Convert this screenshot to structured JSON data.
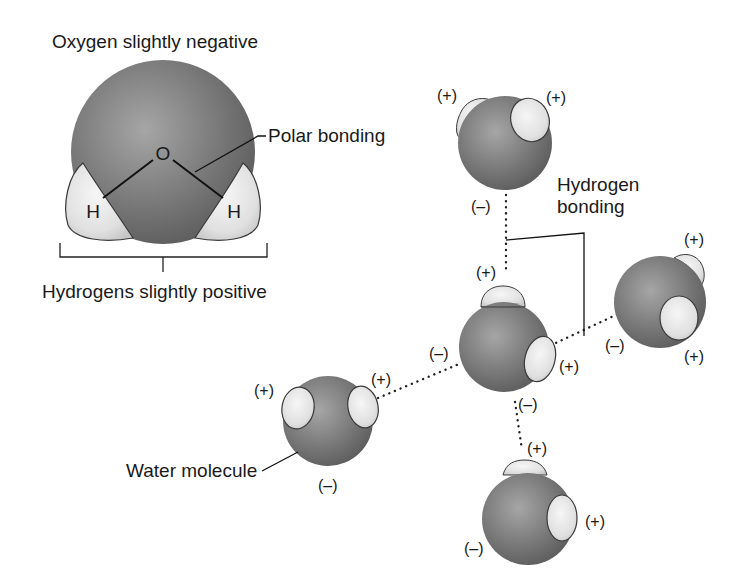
{
  "diagram": {
    "title_oxygen": "Oxygen slightly negative",
    "label_polar": "Polar bonding",
    "label_hydrogens": "Hydrogens slightly positive",
    "label_hbond_line1": "Hydrogen",
    "label_hbond_line2": "bonding",
    "label_water": "Water molecule",
    "atom_o": "O",
    "atom_h_left": "H",
    "atom_h_right": "H",
    "plus": "(+)",
    "minus": "(–)"
  },
  "colors": {
    "oxygen": "#7a7a7a",
    "oxygen_highlight": "#a3a3a3",
    "hydrogen": "#e6e6e6",
    "outline": "#2a2a2a",
    "text": "#1a1a1a"
  },
  "molecules": [
    {
      "id": "top",
      "charges": [
        "(+)",
        "(+)",
        "(–)"
      ]
    },
    {
      "id": "center",
      "charges": [
        "(+)",
        "(–)",
        "(+)",
        "(–)"
      ]
    },
    {
      "id": "right",
      "charges": [
        "(+)",
        "(–)",
        "(+)"
      ]
    },
    {
      "id": "left-water",
      "charges": [
        "(+)",
        "(+)",
        "(–)"
      ]
    },
    {
      "id": "bottom",
      "charges": [
        "(+)",
        "(+)",
        "(–)"
      ]
    }
  ]
}
